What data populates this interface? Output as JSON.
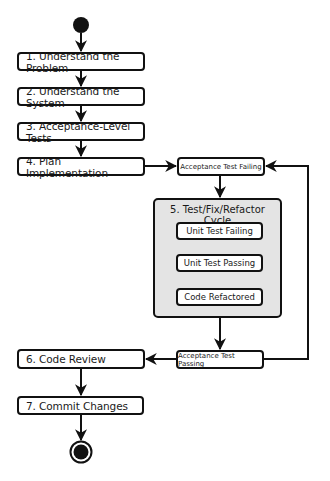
{
  "diagram": {
    "type": "activity-flowchart",
    "start_node": "start-node",
    "end_node": "end-node",
    "steps": [
      {
        "id": "s1",
        "label": "1. Understand the Problem"
      },
      {
        "id": "s2",
        "label": "2. Understand the System"
      },
      {
        "id": "s3",
        "label": "3. Acceptance-Level Tests"
      },
      {
        "id": "s4",
        "label": "4. Plan Implementation"
      },
      {
        "id": "s6",
        "label": "6. Code Review"
      },
      {
        "id": "s7",
        "label": "7. Commit Changes"
      }
    ],
    "states": {
      "acceptance_failing": "Acceptance Test Failing",
      "acceptance_passing": "Acceptance Test Passing"
    },
    "cycle": {
      "title": "5. Test/Fix/Refactor Cycle",
      "states": [
        {
          "id": "c1",
          "label": "Unit Test Failing"
        },
        {
          "id": "c2",
          "label": "Unit Test Passing"
        },
        {
          "id": "c3",
          "label": "Code Refactored"
        }
      ]
    },
    "edges": [
      {
        "from": "start",
        "to": "s1"
      },
      {
        "from": "s1",
        "to": "s2"
      },
      {
        "from": "s2",
        "to": "s3"
      },
      {
        "from": "s3",
        "to": "s4"
      },
      {
        "from": "s4",
        "to": "acceptance_failing"
      },
      {
        "from": "acceptance_failing",
        "to": "cycle"
      },
      {
        "from": "c1",
        "to": "c2"
      },
      {
        "from": "c2",
        "to": "c3"
      },
      {
        "from": "c3",
        "to": "c1"
      },
      {
        "from": "cycle",
        "to": "acceptance_passing"
      },
      {
        "from": "acceptance_passing",
        "to": "acceptance_failing"
      },
      {
        "from": "acceptance_passing",
        "to": "s6"
      },
      {
        "from": "s6",
        "to": "s7"
      },
      {
        "from": "s7",
        "to": "end"
      }
    ],
    "colors": {
      "stroke": "#111111",
      "box_fill": "#ffffff",
      "cycle_fill": "#e4e4e4"
    }
  }
}
